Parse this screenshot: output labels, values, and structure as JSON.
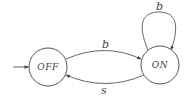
{
  "diagram": {
    "type": "state-machine",
    "states": [
      {
        "id": "off",
        "label": "OFF",
        "initial": true
      },
      {
        "id": "on",
        "label": "ON",
        "initial": false
      }
    ],
    "transitions": [
      {
        "from": "off",
        "to": "on",
        "label": "b"
      },
      {
        "from": "on",
        "to": "on",
        "label": "b"
      },
      {
        "from": "on",
        "to": "off",
        "label": "s"
      }
    ],
    "colors": {
      "stroke": "#555555",
      "text": "#444444",
      "background": "#ffffff"
    }
  }
}
